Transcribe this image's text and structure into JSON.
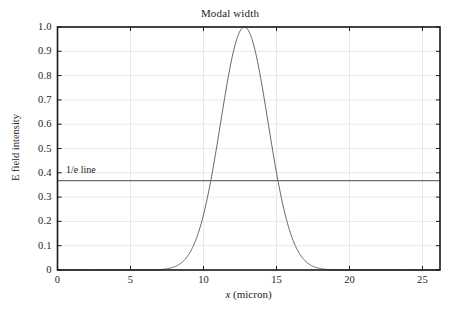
{
  "chart_data": {
    "type": "line",
    "title": "Modal width",
    "xlabel_var": "x",
    "xlabel_unit": " (micron)",
    "xlabel": "x (micron)",
    "ylabel": "E field intensity",
    "xlim": [
      0,
      26.2
    ],
    "ylim": [
      0,
      1.0
    ],
    "grid": true,
    "legend_position": "none",
    "xticks": [
      0,
      5,
      10,
      15,
      20,
      25
    ],
    "xtick_labels": [
      "0",
      "5",
      "10",
      "15",
      "20",
      "25"
    ],
    "yticks": [
      0,
      0.1,
      0.2,
      0.3,
      0.4,
      0.5,
      0.6,
      0.7,
      0.8,
      0.9,
      1.0
    ],
    "ytick_labels": [
      "0",
      "0.1",
      "0.2",
      "0.3",
      "0.4",
      "0.5",
      "0.6",
      "0.7",
      "0.8",
      "0.9",
      "1.0"
    ],
    "annotations": [
      {
        "name": "one-over-e-line",
        "text": "1/e line",
        "type": "hline",
        "y": 0.3679,
        "x_text": 0.6
      }
    ],
    "series": [
      {
        "name": "E field intensity",
        "form": "gaussian",
        "center": 12.8,
        "one_over_e_half_width": 2.3,
        "peak": 1.0,
        "color": "#555555",
        "x": [
          0,
          1,
          2,
          3,
          4,
          5,
          5.5,
          6,
          6.5,
          7,
          7.5,
          8,
          8.5,
          9,
          9.5,
          10,
          10.25,
          10.5,
          10.75,
          11,
          11.25,
          11.5,
          11.75,
          12,
          12.25,
          12.5,
          12.8,
          13,
          13.25,
          13.5,
          13.75,
          14,
          14.25,
          14.5,
          14.75,
          15,
          15.25,
          15.5,
          16,
          16.5,
          17,
          17.5,
          18,
          18.5,
          19,
          19.5,
          20,
          21,
          22,
          23,
          24,
          25,
          26.2
        ],
        "y": [
          0.0,
          0.0,
          0.0,
          0.0,
          0.0,
          0.001,
          0.003,
          0.008,
          0.018,
          0.038,
          0.074,
          0.132,
          0.218,
          0.331,
          0.463,
          0.598,
          0.662,
          0.721,
          0.775,
          0.821,
          0.86,
          0.903,
          0.936,
          0.96,
          0.982,
          0.995,
          1.0,
          0.993,
          0.977,
          0.952,
          0.918,
          0.876,
          0.826,
          0.769,
          0.707,
          0.641,
          0.572,
          0.503,
          0.371,
          0.256,
          0.166,
          0.101,
          0.058,
          0.031,
          0.016,
          0.007,
          0.003,
          0.0,
          0.0,
          0.0,
          0.0,
          0.0,
          0.0
        ]
      }
    ]
  },
  "figure": {
    "background": "#ffffff",
    "axis_color": "#1a1a1a",
    "grid_color": "#e8e8e8",
    "curve_color": "#555555",
    "hline_color": "#6e6e6e",
    "text_color": "#1d1d1d"
  }
}
